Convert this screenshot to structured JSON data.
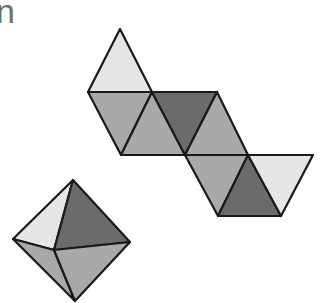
{
  "partial_text": "n",
  "colors": {
    "light": "#e6e6e6",
    "medium": "#a9a9a9",
    "dark": "#6b6b6b",
    "edge": "#1a1a1a"
  },
  "net": {
    "label": "octahedron-net",
    "faces": [
      {
        "name": "face-top-apex",
        "points": "120,29 88,92 152,92",
        "shade": "light"
      },
      {
        "name": "face-row1-a",
        "points": "88,92 152,92 121,155",
        "shade": "medium"
      },
      {
        "name": "face-row1-b",
        "points": "152,92 121,155 185,155",
        "shade": "medium"
      },
      {
        "name": "face-row1-c",
        "points": "152,92 217,92 185,155",
        "shade": "dark"
      },
      {
        "name": "face-row1-d",
        "points": "217,92 185,155 248,155",
        "shade": "medium"
      },
      {
        "name": "face-row2-a",
        "points": "185,155 248,155 218,216",
        "shade": "medium"
      },
      {
        "name": "face-row2-b",
        "points": "248,155 218,216 281,216",
        "shade": "dark"
      },
      {
        "name": "face-row2-c",
        "points": "248,155 313,155 281,216",
        "shade": "light"
      }
    ]
  },
  "solid": {
    "label": "octahedron-3d",
    "faces": [
      {
        "name": "face-upper-left",
        "points": "73,180 13,239 54,250",
        "shade": "light"
      },
      {
        "name": "face-upper-right",
        "points": "73,180 54,250 130,242",
        "shade": "dark"
      },
      {
        "name": "face-lower-left",
        "points": "13,239 54,250 75,301",
        "shade": "medium"
      },
      {
        "name": "face-lower-right",
        "points": "54,250 130,242 75,301",
        "shade": "medium"
      }
    ]
  }
}
